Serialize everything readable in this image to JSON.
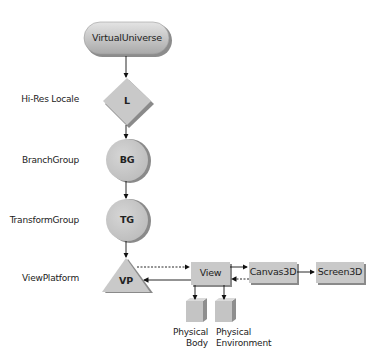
{
  "diagram": {
    "type": "scene-graph",
    "colors": {
      "node_fill": "#c8c8c8",
      "node_shadow": "#8a8a8a",
      "line": "#111111",
      "text": "#222222"
    },
    "nodes": [
      {
        "id": "virtual-universe",
        "shape": "pill",
        "text": "VirtualUniverse"
      },
      {
        "id": "locale",
        "shape": "diamond",
        "text": "L",
        "side_label": "Hi-Res Locale"
      },
      {
        "id": "branch-group",
        "shape": "circle",
        "text": "BG",
        "side_label": "BranchGroup"
      },
      {
        "id": "transform-group",
        "shape": "circle",
        "text": "TG",
        "side_label": "TransformGroup"
      },
      {
        "id": "view-platform",
        "shape": "triangle",
        "text": "VP",
        "side_label": "ViewPlatform"
      },
      {
        "id": "view",
        "shape": "box",
        "text": "View"
      },
      {
        "id": "canvas3d",
        "shape": "box",
        "text": "Canvas3D"
      },
      {
        "id": "screen3d",
        "shape": "box",
        "text": "Screen3D"
      },
      {
        "id": "physical-body",
        "shape": "cube",
        "text": "Physical\nBody",
        "line1": "Physical",
        "line2": "Body"
      },
      {
        "id": "physical-environment",
        "shape": "cube",
        "text": "Physical\nEnvironment",
        "line1": "Physical",
        "line2": "Environment"
      }
    ],
    "edges": [
      {
        "from": "virtual-universe",
        "to": "locale",
        "style": "solid"
      },
      {
        "from": "locale",
        "to": "branch-group",
        "style": "solid"
      },
      {
        "from": "branch-group",
        "to": "transform-group",
        "style": "solid"
      },
      {
        "from": "transform-group",
        "to": "view-platform",
        "style": "solid"
      },
      {
        "from": "view-platform",
        "to": "view",
        "style": "dashed"
      },
      {
        "from": "view",
        "to": "view-platform",
        "style": "solid"
      },
      {
        "from": "view",
        "to": "canvas3d",
        "style": "solid"
      },
      {
        "from": "canvas3d",
        "to": "view",
        "style": "dashed"
      },
      {
        "from": "canvas3d",
        "to": "screen3d",
        "style": "solid"
      },
      {
        "from": "view",
        "to": "physical-body",
        "style": "solid"
      },
      {
        "from": "view",
        "to": "physical-environment",
        "style": "solid"
      }
    ]
  }
}
